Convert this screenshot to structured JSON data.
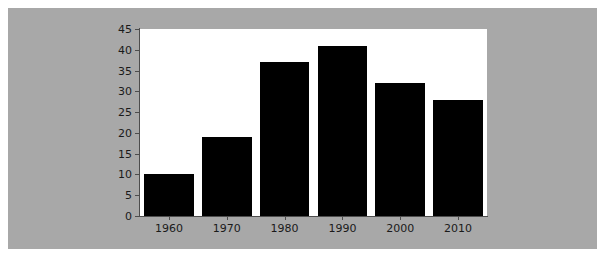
{
  "figure": {
    "background_color": "#a8a8a8",
    "page_background_color": "#ffffff",
    "plot_background_color": "#ffffff",
    "bar_color": "#000000",
    "axis_color": "#4d4d4d",
    "tick_label_color": "#1a1a1a"
  },
  "chart_data": {
    "type": "bar",
    "title": "",
    "subtitle": "",
    "xlabel": "",
    "ylabel": "",
    "categories": [
      "1960",
      "1970",
      "1980",
      "1990",
      "2000",
      "2010"
    ],
    "values": [
      10,
      19,
      37,
      41,
      32,
      28
    ],
    "series": [
      {
        "name": "",
        "values": [
          10,
          19,
          37,
          41,
          32,
          28
        ]
      }
    ],
    "ylim": [
      0,
      45
    ],
    "xlim": [
      0,
      6
    ],
    "ytick_labels": [
      "0",
      "5",
      "10",
      "15",
      "20",
      "25",
      "30",
      "35",
      "40",
      "45"
    ],
    "ytick_values": [
      0,
      5,
      10,
      15,
      20,
      25,
      30,
      35,
      40,
      45
    ],
    "xtick_labels": [
      "1960",
      "1970",
      "1980",
      "1990",
      "2000",
      "2010"
    ],
    "grid": false,
    "legend": null,
    "legend_position": "none",
    "annotations": []
  }
}
